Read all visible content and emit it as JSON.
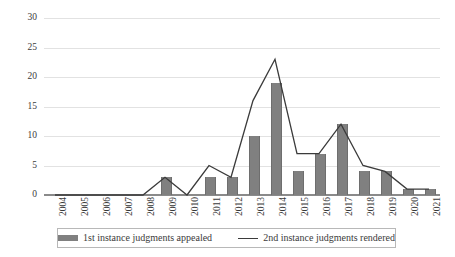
{
  "chart_data": {
    "type": "bar",
    "title": "",
    "subtitle": "",
    "xlabel": "",
    "ylabel": "",
    "xlim_categories": [
      "2004",
      "2005",
      "2006",
      "2007",
      "2008",
      "2009",
      "2010",
      "2011",
      "2012",
      "2013",
      "2014",
      "2015",
      "2016",
      "2017",
      "2018",
      "2019",
      "2020",
      "2021"
    ],
    "ylim": [
      0,
      30
    ],
    "y_ticks": [
      0,
      5,
      10,
      15,
      20,
      25,
      30
    ],
    "grid": true,
    "legend_position": "bottom",
    "categories": [
      "2004",
      "2005",
      "2006",
      "2007",
      "2008",
      "2009",
      "2010",
      "2011",
      "2012",
      "2013",
      "2014",
      "2015",
      "2016",
      "2017",
      "2018",
      "2019",
      "2020",
      "2021"
    ],
    "series": [
      {
        "name": "1st instance judgments appealed",
        "type": "bar",
        "color": "#808080",
        "values": [
          0,
          0,
          0,
          0,
          0,
          3,
          0,
          3,
          3,
          10,
          19,
          4,
          7,
          12,
          4,
          4,
          1,
          1
        ]
      },
      {
        "name": "2nd instance judgments rendered",
        "type": "line",
        "color": "#3b3b3b",
        "values": [
          0,
          0,
          0,
          0,
          0,
          3,
          0,
          5,
          3,
          16,
          23,
          7,
          7,
          12,
          5,
          4,
          1,
          1
        ]
      }
    ]
  },
  "legend": {
    "items": [
      {
        "label": "1st instance judgments appealed",
        "marker": "bar-swatch"
      },
      {
        "label": "2nd instance judgments rendered",
        "marker": "line-swatch"
      }
    ]
  }
}
